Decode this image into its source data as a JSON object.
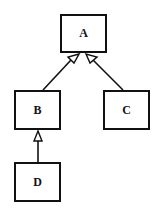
{
  "diagram": {
    "type": "class-hierarchy",
    "nodes": [
      {
        "id": "A",
        "label": "A",
        "x": 60,
        "y": 14,
        "w": 47,
        "h": 39
      },
      {
        "id": "B",
        "label": "B",
        "x": 14,
        "y": 90,
        "w": 47,
        "h": 40
      },
      {
        "id": "C",
        "label": "C",
        "x": 103,
        "y": 90,
        "w": 47,
        "h": 40
      },
      {
        "id": "D",
        "label": "D",
        "x": 14,
        "y": 162,
        "w": 47,
        "h": 40
      }
    ],
    "edges": [
      {
        "from": "B",
        "to": "A",
        "arrow": "hollow-triangle"
      },
      {
        "from": "C",
        "to": "A",
        "arrow": "hollow-triangle"
      },
      {
        "from": "D",
        "to": "B",
        "arrow": "hollow-triangle"
      }
    ],
    "colors": {
      "stroke": "#111111",
      "fill": "#ffffff",
      "background": "#ffffff"
    }
  }
}
